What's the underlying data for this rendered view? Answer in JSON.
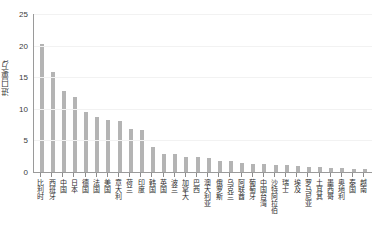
{
  "chart_data": {
    "type": "bar",
    "title": "",
    "xlabel": "",
    "ylabel": "进口量/万t",
    "ylim": [
      0,
      25
    ],
    "yticks": [
      0,
      5,
      10,
      15,
      20,
      25
    ],
    "grid": true,
    "legend": "none",
    "bar_color": "#b4b4b4",
    "axis_color": "#9a9a9a",
    "categories": [
      "比利时",
      "西班牙",
      "中国",
      "日本",
      "德国",
      "法国",
      "美国",
      "意大利",
      "荷兰",
      "印度",
      "韩国",
      "英国",
      "波兰",
      "加拿大",
      "巴西",
      "澳大利亚",
      "俄罗斯",
      "乌克兰",
      "阿联酋",
      "葡萄牙",
      "中国台湾",
      "沙特阿拉伯",
      "瑞士",
      "埃及",
      "罗马尼亚",
      "土耳其",
      "墨西哥",
      "奥地利",
      "泰国",
      "越南"
    ],
    "values": [
      20.2,
      15.9,
      12.8,
      11.8,
      9.5,
      8.7,
      8.3,
      8.1,
      6.8,
      6.6,
      4.0,
      2.9,
      2.8,
      2.4,
      2.3,
      2.2,
      1.7,
      1.8,
      1.5,
      1.3,
      1.2,
      1.1,
      1.1,
      1.0,
      0.8,
      0.8,
      0.7,
      0.6,
      0.5,
      0.5
    ]
  }
}
